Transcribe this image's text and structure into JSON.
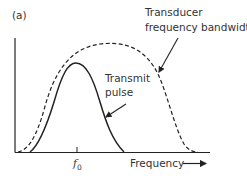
{
  "panel_label": "(a)",
  "colors": {
    "ink": "#222222",
    "text": "#333333",
    "background": "#ffffff"
  },
  "annotations": {
    "transducer_line1": "Transducer",
    "transducer_line2": "frequency bandwidth",
    "transmit_line1": "Transmit",
    "transmit_line2": "pulse"
  },
  "axis": {
    "x_label": "Frequency",
    "tick_label_base": "f",
    "tick_label_sub": "0"
  },
  "curves": [
    {
      "name": "Transmit pulse",
      "style": "solid",
      "shape": "narrow bell centered at f0"
    },
    {
      "name": "Transducer frequency bandwidth",
      "style": "dashed",
      "shape": "broad bell encompassing pulse"
    }
  ]
}
